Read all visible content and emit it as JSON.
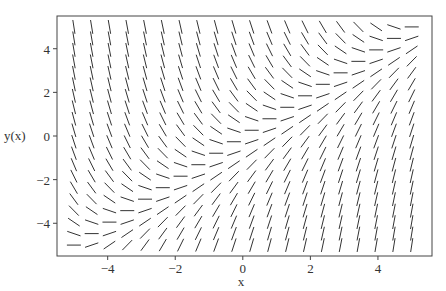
{
  "chart_data": {
    "type": "slope_field",
    "title": "",
    "equation": "dy/dx = x - y",
    "xlabel": "x",
    "ylabel": "y(x)",
    "xlim": [
      -5.5,
      5.6
    ],
    "ylim": [
      -5.5,
      5.5
    ],
    "grid_points": {
      "x_from": -5,
      "x_to": 5,
      "y_from": -5,
      "y_to": 5,
      "n": 20
    },
    "xticks": [
      -4,
      -2,
      0,
      2,
      4
    ],
    "yticks": [
      -4,
      -2,
      0,
      2,
      4
    ],
    "xtick_labels": [
      "−4",
      "−2",
      "0",
      "2",
      "4"
    ],
    "ytick_labels": [
      "−4",
      "−2",
      "0",
      "2",
      "4"
    ],
    "grid": false,
    "legend": null
  },
  "colors": {
    "segment": "#333333",
    "frame": "#444444"
  }
}
